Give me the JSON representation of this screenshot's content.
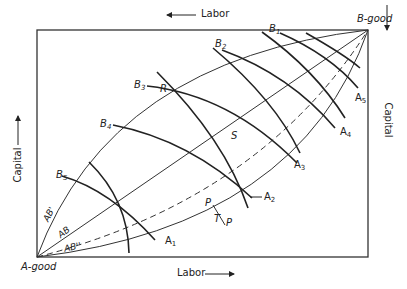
{
  "axes": {
    "top_label": "Labor",
    "bottom_label": "Labor",
    "left_label": "Capital",
    "right_label": "Capital"
  },
  "origins": {
    "a_origin": "A-good",
    "b_origin": "B-good"
  },
  "curves": {
    "ab_prime": "AB'",
    "ab": "AB",
    "ab_double_prime": "AB''"
  },
  "b_isoquants": [
    {
      "label": "B",
      "sub": "1"
    },
    {
      "label": "B",
      "sub": "2"
    },
    {
      "label": "B",
      "sub": "3"
    },
    {
      "label": "B",
      "sub": "4"
    },
    {
      "label": "B",
      "sub": "5"
    }
  ],
  "a_isoquants": [
    {
      "label": "A",
      "sub": "1"
    },
    {
      "label": "A",
      "sub": "2"
    },
    {
      "label": "A",
      "sub": "3"
    },
    {
      "label": "A",
      "sub": "4"
    },
    {
      "label": "A",
      "sub": "5"
    }
  ],
  "points": {
    "r": "R",
    "s": "S",
    "t": "T",
    "p_upper": "P",
    "p_lower": "P"
  },
  "colors": {
    "ink": "#222222",
    "background": "#ffffff"
  }
}
